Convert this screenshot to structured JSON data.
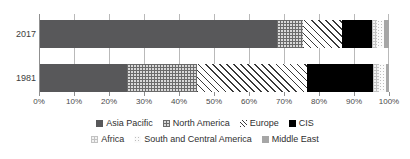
{
  "chart_data": {
    "type": "bar",
    "orientation": "horizontal",
    "stacked": true,
    "stack_mode": "percent",
    "title": "",
    "subtitle": "",
    "xlabel": "",
    "ylabel": "",
    "categories": [
      "2017",
      "1981"
    ],
    "xlim": [
      0,
      100
    ],
    "xticks": [
      0,
      10,
      20,
      30,
      40,
      50,
      60,
      70,
      80,
      90,
      100
    ],
    "xticklabels": [
      "0%",
      "10%",
      "20%",
      "30%",
      "40%",
      "50%",
      "60%",
      "70%",
      "80%",
      "90%",
      "100%"
    ],
    "grid": true,
    "grid_axis": "x",
    "legend_position": "bottom",
    "series": [
      {
        "name": "Asia Pacific",
        "pattern": "solid-dark-gray",
        "color": "#58585A",
        "values": [
          68.0,
          25.0
        ]
      },
      {
        "name": "North America",
        "pattern": "crosshatch-gray",
        "color": "#D9D9D9",
        "values": [
          7.5,
          20.0
        ]
      },
      {
        "name": "Europe",
        "pattern": "diagonal-hatch",
        "color": "#FFFFFF",
        "values": [
          11.0,
          31.5
        ]
      },
      {
        "name": "CIS",
        "pattern": "solid-black",
        "color": "#000000",
        "values": [
          8.5,
          19.0
        ]
      },
      {
        "name": "Africa",
        "pattern": "fine-crosshatch-light",
        "color": "#F2F2F2",
        "values": [
          1.7,
          1.5
        ]
      },
      {
        "name": "South and Central America",
        "pattern": "dotted-light",
        "color": "#FBFBFB",
        "values": [
          2.0,
          2.0
        ]
      },
      {
        "name": "Middle East",
        "pattern": "solid-mid-gray",
        "color": "#A6A6A6",
        "values": [
          1.3,
          1.0
        ]
      }
    ]
  },
  "axis": {
    "x_tick_labels": [
      "0%",
      "10%",
      "20%",
      "30%",
      "40%",
      "50%",
      "60%",
      "70%",
      "80%",
      "90%",
      "100%"
    ],
    "y_tick_labels": [
      "2017",
      "1981"
    ]
  },
  "legend": {
    "row1": [
      {
        "label": "Asia Pacific",
        "swatch": "solid-dark-gray",
        "color": "#58585A"
      },
      {
        "label": "North America",
        "swatch": "crosshatch-gray",
        "color": "#D9D9D9"
      },
      {
        "label": "Europe",
        "swatch": "diagonal-hatch",
        "color": "#FFFFFF"
      },
      {
        "label": "CIS",
        "swatch": "solid-black",
        "color": "#000000"
      }
    ],
    "row2": [
      {
        "label": "Africa",
        "swatch": "fine-crosshatch-light",
        "color": "#F2F2F2"
      },
      {
        "label": "South and Central America",
        "swatch": "dotted-light",
        "color": "#FBFBFB"
      },
      {
        "label": "Middle East",
        "swatch": "solid-mid-gray",
        "color": "#A6A6A6"
      }
    ]
  },
  "colors": {
    "gridline": "#B9B9B9",
    "axis": "#8F8F8F",
    "text": "#333333",
    "background": "#FFFFFF"
  }
}
